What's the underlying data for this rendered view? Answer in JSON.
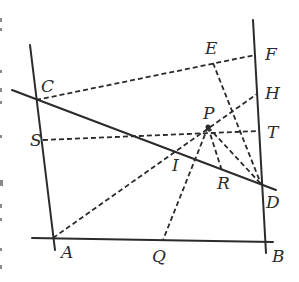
{
  "figure": {
    "points": [
      {
        "name": "A",
        "x": 53,
        "y": 238,
        "label_dx": 8,
        "label_dy": 20
      },
      {
        "name": "B",
        "x": 265,
        "y": 242,
        "label_dx": 7,
        "label_dy": 20
      },
      {
        "name": "C",
        "x": 36,
        "y": 100,
        "label_dx": 5,
        "label_dy": -8
      },
      {
        "name": "D",
        "x": 261,
        "y": 184,
        "label_dx": 5,
        "label_dy": 24
      },
      {
        "name": "E",
        "x": 213,
        "y": 63,
        "label_dx": -8,
        "label_dy": -9
      },
      {
        "name": "F",
        "x": 255,
        "y": 55,
        "label_dx": 10,
        "label_dy": 5
      },
      {
        "name": "H",
        "x": 257,
        "y": 94,
        "label_dx": 8,
        "label_dy": 5
      },
      {
        "name": "T",
        "x": 259,
        "y": 131,
        "label_dx": 8,
        "label_dy": 7
      },
      {
        "name": "S",
        "x": 43,
        "y": 140,
        "label_dx": -13,
        "label_dy": 6
      },
      {
        "name": "P",
        "x": 208,
        "y": 127,
        "label_dx": -5,
        "label_dy": -8
      },
      {
        "name": "I",
        "x": 175,
        "y": 153,
        "label_dx": -3,
        "label_dy": 18
      },
      {
        "name": "R",
        "x": 222,
        "y": 171,
        "label_dx": -5,
        "label_dy": 18
      },
      {
        "name": "Q",
        "x": 163,
        "y": 240,
        "label_dx": -11,
        "label_dy": 22
      }
    ],
    "solid_lines": [
      {
        "name": "line-AC",
        "x1": 30,
        "y1": 45,
        "x2": 55,
        "y2": 250
      },
      {
        "name": "line-BF",
        "x1": 253,
        "y1": 20,
        "x2": 266,
        "y2": 253
      },
      {
        "name": "line-AB",
        "x1": 32,
        "y1": 238,
        "x2": 273,
        "y2": 242
      },
      {
        "name": "line-CD",
        "x1": 12,
        "y1": 90,
        "x2": 276,
        "y2": 190
      }
    ],
    "dashed_lines": [
      {
        "name": "segment-CF",
        "from": "C",
        "to": "F"
      },
      {
        "name": "segment-ST",
        "from": "S",
        "to": "T"
      },
      {
        "name": "segment-AH",
        "from": "A",
        "to": "H"
      },
      {
        "name": "segment-ED",
        "from": "E",
        "to": "D"
      },
      {
        "name": "segment-PD",
        "from": "P",
        "to": "D"
      },
      {
        "name": "segment-PR",
        "from": "P",
        "to": "R"
      },
      {
        "name": "segment-PQ",
        "from": "P",
        "to": "Q"
      }
    ],
    "colors": {
      "ink": "#2b2b2b",
      "background": "#ffffff"
    }
  }
}
